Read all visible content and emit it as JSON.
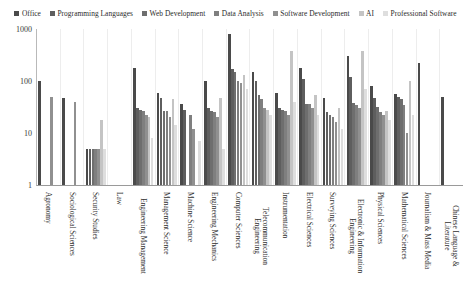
{
  "legend": {
    "position": "top",
    "items": [
      {
        "label": "Office",
        "color": "#4a4a4a"
      },
      {
        "label": "Programming Languages",
        "color": "#5e5e5e"
      },
      {
        "label": "Web Development",
        "color": "#6e6e6e"
      },
      {
        "label": "Data Analysis",
        "color": "#7f7f7f"
      },
      {
        "label": "Software Development",
        "color": "#909090"
      },
      {
        "label": "AI",
        "color": "#c4c4c4"
      },
      {
        "label": "Professional Software",
        "color": "#dedede"
      }
    ]
  },
  "axes": {
    "yticks": [
      "1000",
      "100",
      "10",
      "1"
    ],
    "ylabel": "",
    "xlabel": ""
  },
  "chart_data": {
    "type": "bar",
    "title": "",
    "xlabel": "",
    "ylabel": "",
    "yscale": "log",
    "ylim": [
      1,
      1000
    ],
    "ytick_values": [
      1,
      10,
      100,
      1000
    ],
    "grid": "vertical-category-separators",
    "legend_position": "top",
    "series_names": [
      "Office",
      "Programming Languages",
      "Web Development",
      "Data Analysis",
      "Software Development",
      "AI",
      "Professional Software"
    ],
    "series_colors": [
      "#4a4a4a",
      "#5e5e5e",
      "#6e6e6e",
      "#7f7f7f",
      "#909090",
      "#c4c4c4",
      "#dedede"
    ],
    "categories": [
      "Agronomy",
      "Sociological Sciences",
      "Security Studies",
      "Law",
      "Engineering Management",
      "Management Science",
      "Machine Science",
      "Engineering Mechanics",
      "Computer Sciences",
      "Telecommunication Engineering",
      "Instrumentation",
      "Electrical Sciences",
      "Surveying Sciences",
      "Electronic & Information Engineering",
      "Physical Sciences",
      "Mathematical Sciences",
      "Journalism & Mass Media",
      "Chinese Language & Literature"
    ],
    "series": [
      {
        "name": "Office",
        "values": [
          100,
          48,
          5,
          0,
          180,
          60,
          36,
          100,
          800,
          150,
          58,
          180,
          48,
          300,
          80,
          56,
          220,
          50
        ]
      },
      {
        "name": "Programming Languages",
        "values": [
          0,
          0,
          5,
          0,
          30,
          48,
          28,
          30,
          170,
          100,
          30,
          110,
          25,
          120,
          48,
          50,
          0,
          0
        ]
      },
      {
        "name": "Web Development",
        "values": [
          0,
          0,
          5,
          0,
          28,
          26,
          0,
          26,
          150,
          55,
          28,
          36,
          22,
          38,
          32,
          45,
          0,
          0
        ]
      },
      {
        "name": "Data Analysis",
        "values": [
          0,
          0,
          5,
          0,
          26,
          26,
          22,
          25,
          100,
          45,
          26,
          36,
          20,
          35,
          25,
          35,
          0,
          0
        ]
      },
      {
        "name": "Software Development",
        "values": [
          50,
          40,
          5,
          0,
          22,
          20,
          12,
          20,
          90,
          30,
          22,
          30,
          16,
          30,
          22,
          10,
          0,
          0
        ]
      },
      {
        "name": "AI",
        "values": [
          0,
          0,
          18,
          0,
          20,
          45,
          0,
          48,
          130,
          28,
          380,
          55,
          30,
          380,
          26,
          100,
          0,
          0
        ]
      },
      {
        "name": "Professional Software",
        "values": [
          0,
          0,
          5,
          0,
          8,
          14,
          7,
          5,
          70,
          22,
          40,
          22,
          12,
          70,
          18,
          22,
          0,
          0
        ]
      }
    ]
  }
}
